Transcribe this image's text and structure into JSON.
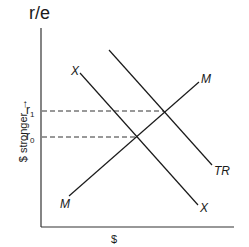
{
  "diagram": {
    "y_axis_label": "r/e",
    "y_axis_side_label": "$ stronger →",
    "x_axis_label": "$",
    "levels": [
      {
        "label": "r",
        "sub": "1",
        "y": 111
      },
      {
        "label": "r",
        "sub": "0",
        "y": 137
      }
    ],
    "curves": [
      {
        "name": "TR",
        "label": "TR"
      },
      {
        "name": "X",
        "label_top": "X",
        "label_bottom": "X"
      },
      {
        "name": "M",
        "label_top": "M",
        "label_bottom": "M"
      }
    ],
    "colors": {
      "line": "#1a1a1a",
      "dash": "#333333"
    }
  }
}
